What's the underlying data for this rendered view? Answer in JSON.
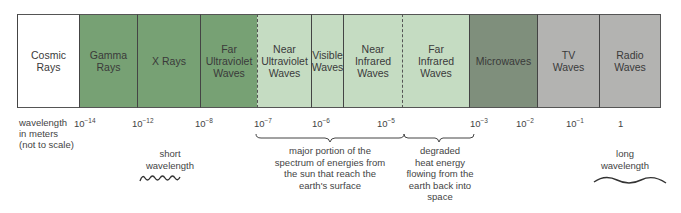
{
  "diagram": {
    "bands": [
      {
        "label": "Cosmic\nRays",
        "color": "#ffffff"
      },
      {
        "label": "Gamma\nRays",
        "color": "#77a174"
      },
      {
        "label": "X Rays",
        "color": "#77a174"
      },
      {
        "label": "Far\nUltraviolet\nWaves",
        "color": "#77a174"
      },
      {
        "label": "Near\nUltraviolet\nWaves",
        "color": "#c5dcc2"
      },
      {
        "label": "Visible\nWaves",
        "color": "#c5dcc2"
      },
      {
        "label": "Near\nInfrared\nWaves",
        "color": "#c5dcc2"
      },
      {
        "label": "Far\nInfrared\nWaves",
        "color": "#c5dcc2"
      },
      {
        "label": "Microwaves",
        "color": "#7f8f7c"
      },
      {
        "label": "TV\nWaves",
        "color": "#b3b3b1"
      },
      {
        "label": "Radio\nWaves",
        "color": "#b3b3b1"
      }
    ],
    "axis_label": "wavelength\nin meters\n(not to scale)",
    "ticks": [
      {
        "base": "10",
        "exp": "−14"
      },
      {
        "base": "10",
        "exp": "−12"
      },
      {
        "base": "10",
        "exp": "−8"
      },
      {
        "base": "10",
        "exp": "−7"
      },
      {
        "base": "10",
        "exp": "−6"
      },
      {
        "base": "10",
        "exp": "−5"
      },
      {
        "base": "10",
        "exp": "−3"
      },
      {
        "base": "10",
        "exp": "−2"
      },
      {
        "base": "10",
        "exp": "−1"
      },
      {
        "base": "1",
        "exp": ""
      }
    ],
    "notes": {
      "short": "short\nwavelength",
      "long": "long\nwavelength",
      "solar": "major portion of the\nspectrum of energies from\nthe sun that reach the\nearth's surface",
      "heat": "degraded\nheat energy\nflowing from the\nearth back into\nspace"
    },
    "icons": {
      "short_wave": "short-wave-squiggle-icon",
      "long_wave": "long-wave-curve-icon",
      "brace": "curly-brace-icon"
    }
  }
}
